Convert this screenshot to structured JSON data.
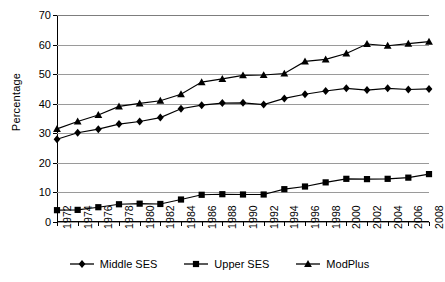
{
  "chart_data": {
    "type": "line",
    "title": "",
    "xlabel": "",
    "ylabel": "Percentage",
    "ylim": [
      0,
      70
    ],
    "ytick_step": 10,
    "yticks": [
      0,
      10,
      20,
      30,
      40,
      50,
      60,
      70
    ],
    "grid": true,
    "legend_position": "bottom",
    "categories": [
      "1972",
      "1974",
      "1976",
      "1978",
      "1980",
      "1982",
      "1984",
      "1986",
      "1988",
      "1990",
      "1992",
      "1994",
      "1996",
      "1998",
      "2000",
      "2002",
      "2004",
      "2006",
      "2008"
    ],
    "series": [
      {
        "name": "Middle SES",
        "marker": "diamond",
        "color": "#000000",
        "values": [
          28.0,
          30.2,
          31.4,
          33.1,
          34.0,
          35.3,
          38.3,
          39.5,
          40.2,
          40.3,
          39.7,
          41.8,
          43.2,
          44.3,
          45.2,
          44.6,
          45.2,
          44.8,
          45.0
        ]
      },
      {
        "name": "Upper SES",
        "marker": "square",
        "color": "#000000",
        "values": [
          4.0,
          4.1,
          5.0,
          6.0,
          6.2,
          6.1,
          7.6,
          9.2,
          9.4,
          9.3,
          9.3,
          11.1,
          12.0,
          13.4,
          14.6,
          14.5,
          14.6,
          15.0,
          16.2
        ]
      },
      {
        "name": "ModPlus",
        "marker": "triangle",
        "color": "#000000",
        "values": [
          31.5,
          34.0,
          36.2,
          39.1,
          40.1,
          41.0,
          43.2,
          47.3,
          48.4,
          49.6,
          49.7,
          50.2,
          54.3,
          55.0,
          57.0,
          60.2,
          59.6,
          60.3,
          61.0
        ]
      }
    ]
  },
  "axis": {
    "y_title": "Percentage"
  },
  "legend": {
    "items": [
      {
        "label": "Middle SES",
        "marker": "diamond"
      },
      {
        "label": "Upper SES",
        "marker": "square"
      },
      {
        "label": "ModPlus",
        "marker": "triangle"
      }
    ]
  }
}
